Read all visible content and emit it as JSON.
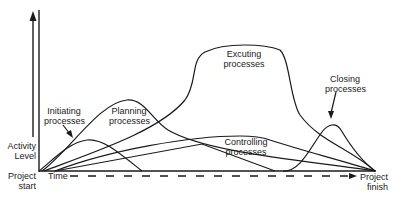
{
  "diagram": {
    "type": "process-group-activity-overlap",
    "axes": {
      "y_label_line1": "Activity",
      "y_label_line2": "Level",
      "x_label": "Time",
      "start_line1": "Project",
      "start_line2": "start",
      "finish_line1": "Project",
      "finish_line2": "finish"
    },
    "curves": [
      {
        "id": "initiating",
        "line1": "Initiating",
        "line2": "processes"
      },
      {
        "id": "planning",
        "line1": "Planning",
        "line2": "processes"
      },
      {
        "id": "executing",
        "line1": "Excuting",
        "line2": "processes"
      },
      {
        "id": "controlling",
        "line1": "Controlling",
        "line2": "processes"
      },
      {
        "id": "closing",
        "line1": "Closing",
        "line2": "processes"
      }
    ],
    "colors": {
      "line": "#1a1a1a",
      "background": "#ffffff"
    }
  }
}
